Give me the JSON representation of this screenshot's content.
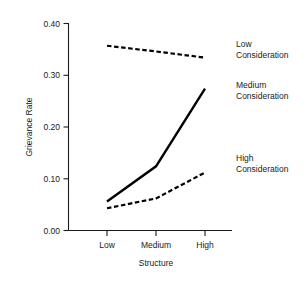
{
  "chart_data": {
    "type": "line",
    "title": "",
    "subtitle": "",
    "xlabel": "Structure",
    "ylabel": "Grievance Rate",
    "categories": [
      "Low",
      "Medium",
      "High"
    ],
    "x_tick_labels": [
      "Low",
      "Medium",
      "High"
    ],
    "y_tick_labels": [
      "0.00",
      "0.10",
      "0.20",
      "0.30",
      "0.40"
    ],
    "y_ticks": [
      0.0,
      0.1,
      0.2,
      0.3,
      0.4
    ],
    "ylim": [
      0.0,
      0.4
    ],
    "xlim": [
      0,
      2
    ],
    "grid": false,
    "legend_position": "right-inline-annotations",
    "series": [
      {
        "name": "Low Consideration",
        "label_line1": "Low",
        "label_line2": "Consideration",
        "style": "dashed",
        "color": "#000000",
        "values": [
          0.357,
          0.346,
          0.334
        ]
      },
      {
        "name": "Medium Consideration",
        "label_line1": "Medium",
        "label_line2": "Consideration",
        "style": "solid",
        "color": "#000000",
        "values": [
          0.056,
          0.124,
          0.274
        ]
      },
      {
        "name": "High Consideration",
        "label_line1": "High",
        "label_line2": "Consideration",
        "style": "dashed",
        "color": "#000000",
        "values": [
          0.043,
          0.062,
          0.112
        ]
      }
    ]
  },
  "axes": {
    "y_title": "Grievance Rate",
    "x_title": "Structure",
    "y_tick_0": "0.00",
    "y_tick_1": "0.10",
    "y_tick_2": "0.20",
    "y_tick_3": "0.30",
    "y_tick_4": "0.40",
    "x_tick_0": "Low",
    "x_tick_1": "Medium",
    "x_tick_2": "High"
  },
  "annotations": {
    "low_line1": "Low",
    "low_line2": "Consideration",
    "medium_line1": "Medium",
    "medium_line2": "Consideration",
    "high_line1": "High",
    "high_line2": "Consideration"
  }
}
